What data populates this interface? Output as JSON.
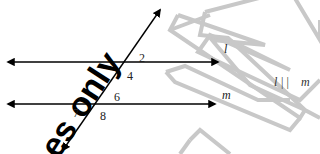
{
  "diagram": {
    "type": "parallel-lines-transversal",
    "lines": {
      "l": {
        "label": "l",
        "y": 62,
        "x1": 8,
        "x2": 218
      },
      "m": {
        "label": "m",
        "y": 104,
        "x1": 8,
        "x2": 215
      },
      "transversal": {
        "x1": 160,
        "y1": 10,
        "x2": 63,
        "y2": 150
      }
    },
    "angle_labels": [
      {
        "id": "2",
        "text": "2",
        "x": 139,
        "y": 62
      },
      {
        "id": "4",
        "text": "4",
        "x": 127,
        "y": 80
      },
      {
        "id": "6",
        "text": "6",
        "x": 114,
        "y": 101
      },
      {
        "id": "7",
        "text": "7",
        "x": 73,
        "y": 117
      },
      {
        "id": "8",
        "text": "8",
        "x": 100,
        "y": 120
      }
    ],
    "statement": {
      "left": "l",
      "symbol": "| |",
      "right": "m"
    },
    "colors": {
      "lines": "#000000",
      "labels": "#222222",
      "watermark_outline": "#c8c8c8",
      "watermark_text": "#000000"
    }
  },
  "watermark": {
    "text": "es only",
    "outline_shape": "N"
  }
}
